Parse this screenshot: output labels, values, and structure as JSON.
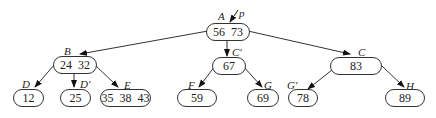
{
  "diagram": {
    "type": "B-tree",
    "nodes": {
      "A": {
        "label": "A",
        "keys": "56 73"
      },
      "B": {
        "label": "B",
        "keys": "24 32"
      },
      "C_prime": {
        "label": "C′",
        "keys": "67"
      },
      "C": {
        "label": "C",
        "keys": "83"
      },
      "D": {
        "label": "D",
        "keys": "12"
      },
      "D_prime": {
        "label": "D′",
        "keys": "25"
      },
      "E": {
        "label": "E",
        "keys": "35 38 43"
      },
      "F": {
        "label": "F",
        "keys": "59"
      },
      "G": {
        "label": "G",
        "keys": "69"
      },
      "G_prime": {
        "label": "G′",
        "keys": "78"
      },
      "H": {
        "label": "H",
        "keys": "89"
      }
    },
    "pointer": {
      "label": "p",
      "target": "A"
    },
    "edges": [
      [
        "A",
        "B"
      ],
      [
        "A",
        "C_prime"
      ],
      [
        "A",
        "C"
      ],
      [
        "B",
        "D"
      ],
      [
        "B",
        "D_prime"
      ],
      [
        "B",
        "E"
      ],
      [
        "C_prime",
        "F"
      ],
      [
        "C_prime",
        "G"
      ],
      [
        "C",
        "G_prime"
      ],
      [
        "C",
        "H"
      ]
    ]
  }
}
